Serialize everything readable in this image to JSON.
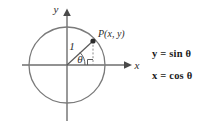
{
  "figure": {
    "background_color": "#ffffff",
    "stroke_color": "#6e6e6e",
    "text_color": "#2b2b2b"
  },
  "diagram": {
    "circle": {
      "name": "unit-circle",
      "center_x": 67,
      "center_y": 65,
      "radius": 38
    },
    "axes": {
      "x_label": "x",
      "y_label": "y",
      "x_start": 22,
      "x_end": 130,
      "y_start": 120,
      "y_end": 10
    },
    "point": {
      "label": "P(x, y)",
      "x": 93,
      "y": 41
    },
    "radius_segment": {
      "label": "1"
    },
    "angle": {
      "label": "θ"
    },
    "right_angle_marker": {
      "label": "right-angle"
    }
  },
  "equations": {
    "sine": "y = sin θ",
    "cosine": "x = cos θ"
  }
}
